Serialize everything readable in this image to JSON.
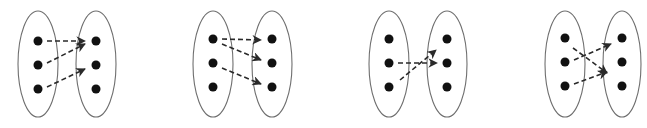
{
  "diagrams": [
    {
      "id": "mapping-1",
      "domain_set": {
        "cx": 38,
        "cy": 64,
        "rx": 20,
        "ry": 53
      },
      "codomain_set": {
        "cx": 96,
        "cy": 64,
        "rx": 20,
        "ry": 53
      },
      "domain_points": [
        [
          38,
          41
        ],
        [
          38,
          65
        ],
        [
          38,
          89
        ]
      ],
      "codomain_points": [
        [
          96,
          41
        ],
        [
          96,
          65
        ],
        [
          96,
          89
        ]
      ],
      "arrows": [
        {
          "from": [
            47,
            41
          ],
          "to": [
            85,
            41
          ]
        },
        {
          "from": [
            47,
            63
          ],
          "to": [
            85,
            44
          ]
        },
        {
          "from": [
            47,
            87
          ],
          "to": [
            85,
            69
          ]
        }
      ]
    },
    {
      "id": "mapping-2",
      "domain_set": {
        "cx": 213,
        "cy": 64,
        "rx": 20,
        "ry": 53
      },
      "codomain_set": {
        "cx": 272,
        "cy": 64,
        "rx": 20,
        "ry": 53
      },
      "domain_points": [
        [
          213,
          39
        ],
        [
          213,
          63
        ],
        [
          213,
          87
        ]
      ],
      "codomain_points": [
        [
          272,
          39
        ],
        [
          272,
          63
        ],
        [
          272,
          87
        ]
      ],
      "arrows": [
        {
          "from": [
            222,
            39
          ],
          "to": [
            261,
            40
          ]
        },
        {
          "from": [
            222,
            44
          ],
          "to": [
            261,
            60
          ]
        },
        {
          "from": [
            222,
            68
          ],
          "to": [
            261,
            84
          ]
        }
      ]
    },
    {
      "id": "mapping-3",
      "domain_set": {
        "cx": 389,
        "cy": 64,
        "rx": 20,
        "ry": 53
      },
      "codomain_set": {
        "cx": 447,
        "cy": 64,
        "rx": 20,
        "ry": 53
      },
      "domain_points": [
        [
          389,
          39
        ],
        [
          389,
          63
        ],
        [
          389,
          87
        ]
      ],
      "codomain_points": [
        [
          447,
          39
        ],
        [
          447,
          63
        ],
        [
          447,
          87
        ]
      ],
      "arrows": [
        {
          "from": [
            398,
            63
          ],
          "to": [
            437,
            63
          ]
        },
        {
          "from": [
            400,
            80
          ],
          "to": [
            436,
            50
          ]
        }
      ]
    },
    {
      "id": "mapping-4",
      "domain_set": {
        "cx": 565,
        "cy": 64,
        "rx": 20,
        "ry": 53
      },
      "codomain_set": {
        "cx": 622,
        "cy": 64,
        "rx": 19,
        "ry": 53
      },
      "domain_points": [
        [
          565,
          38
        ],
        [
          565,
          62
        ],
        [
          565,
          86
        ]
      ],
      "codomain_points": [
        [
          622,
          38
        ],
        [
          622,
          62
        ],
        [
          622,
          86
        ]
      ],
      "arrows": [
        {
          "from": [
            574,
            60
          ],
          "to": [
            611,
            44
          ]
        },
        {
          "from": [
            573,
            48
          ],
          "to": [
            607,
            73
          ]
        },
        {
          "from": [
            574,
            84
          ],
          "to": [
            607,
            72
          ]
        }
      ]
    }
  ]
}
